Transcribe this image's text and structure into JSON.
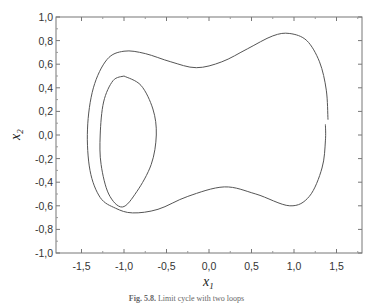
{
  "chart_data": {
    "type": "line",
    "title": "",
    "xlabel": "x1",
    "ylabel": "x2",
    "xlim": [
      -1.8,
      1.8
    ],
    "ylim": [
      -1.0,
      1.0
    ],
    "grid": false,
    "legend": null,
    "x_ticks": [
      "-1,5",
      "-1,0",
      "-0,5",
      "0,0",
      "0,5",
      "1,0",
      "1,5"
    ],
    "x_tick_values": [
      -1.5,
      -1.0,
      -0.5,
      0.0,
      0.5,
      1.0,
      1.5
    ],
    "y_ticks": [
      "1,0",
      "0,8",
      "0,6",
      "0,4",
      "0,2",
      "0,0",
      "-0,2",
      "-0,4",
      "-0,6",
      "-0,8",
      "-1,0"
    ],
    "y_tick_values": [
      1.0,
      0.8,
      0.6,
      0.4,
      0.2,
      0.0,
      -0.2,
      -0.4,
      -0.6,
      -0.8,
      -1.0
    ],
    "series": [
      {
        "name": "phase trajectory",
        "color": "#555555",
        "points": [
          [
            1.4,
            0.13
          ],
          [
            1.38,
            0.38
          ],
          [
            1.3,
            0.62
          ],
          [
            1.15,
            0.8
          ],
          [
            0.95,
            0.86
          ],
          [
            0.75,
            0.84
          ],
          [
            0.45,
            0.73
          ],
          [
            0.15,
            0.62
          ],
          [
            -0.15,
            0.57
          ],
          [
            -0.45,
            0.62
          ],
          [
            -0.75,
            0.69
          ],
          [
            -1.0,
            0.71
          ],
          [
            -1.2,
            0.64
          ],
          [
            -1.36,
            0.4
          ],
          [
            -1.43,
            0.05
          ],
          [
            -1.4,
            -0.3
          ],
          [
            -1.28,
            -0.53
          ],
          [
            -1.1,
            -0.62
          ],
          [
            -0.9,
            -0.66
          ],
          [
            -0.6,
            -0.63
          ],
          [
            -0.25,
            -0.52
          ],
          [
            0.18,
            -0.44
          ],
          [
            0.55,
            -0.5
          ],
          [
            0.95,
            -0.6
          ],
          [
            1.18,
            -0.52
          ],
          [
            1.33,
            -0.28
          ],
          [
            1.37,
            -0.05
          ],
          [
            1.37,
            0.09
          ]
        ]
      },
      {
        "name": "inner loop",
        "color": "#555555",
        "points": [
          [
            -1.0,
            0.5
          ],
          [
            -0.8,
            0.42
          ],
          [
            -0.66,
            0.22
          ],
          [
            -0.62,
            0.0
          ],
          [
            -0.68,
            -0.25
          ],
          [
            -0.85,
            -0.48
          ],
          [
            -1.02,
            -0.61
          ],
          [
            -1.18,
            -0.5
          ],
          [
            -1.27,
            -0.25
          ],
          [
            -1.28,
            0.0
          ],
          [
            -1.24,
            0.28
          ],
          [
            -1.13,
            0.46
          ],
          [
            -1.0,
            0.5
          ]
        ]
      }
    ]
  },
  "figure": {
    "xlabel_main": "x",
    "xlabel_sub": "1",
    "ylabel_main": "x",
    "ylabel_sub": "2",
    "caption_prefix": "Fig. 5.8.",
    "caption_text": "Limit cycle with two loops"
  }
}
